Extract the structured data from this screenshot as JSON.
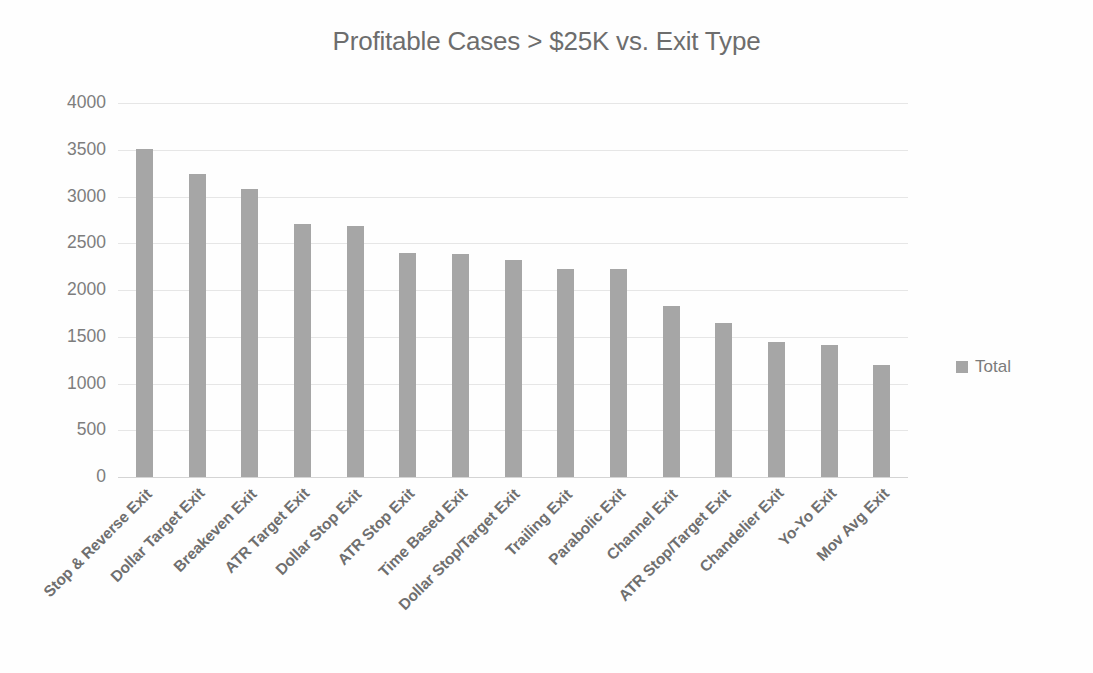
{
  "chart_data": {
    "type": "bar",
    "title": "Profitable Cases > $25K vs. Exit Type",
    "xlabel": "",
    "ylabel": "",
    "ylim": [
      0,
      4000
    ],
    "ytick_step": 500,
    "yticks": [
      "4000",
      "3500",
      "3000",
      "2500",
      "2000",
      "1500",
      "1000",
      "500",
      "0"
    ],
    "grid": true,
    "legend_position": "right",
    "series": [
      {
        "name": "Total",
        "color": "#a6a6a6",
        "values": [
          3510,
          3240,
          3080,
          2710,
          2690,
          2400,
          2380,
          2320,
          2230,
          2220,
          1830,
          1650,
          1440,
          1410,
          1200
        ]
      }
    ],
    "categories": [
      "Stop & Reverse Exit",
      "Dollar Target Exit",
      "Breakeven Exit",
      "ATR Target Exit",
      "Dollar Stop Exit",
      "ATR Stop Exit",
      "Time Based Exit",
      "Dollar Stop/Target Exit",
      "Trailing Exit",
      "Parabolic Exit",
      "Channel Exit",
      "ATR Stop/Target Exit",
      "Chandelier Exit",
      "Yo-Yo Exit",
      "Mov Avg Exit"
    ]
  },
  "legend": {
    "items": [
      {
        "label": "Total",
        "color": "#a6a6a6"
      }
    ]
  }
}
